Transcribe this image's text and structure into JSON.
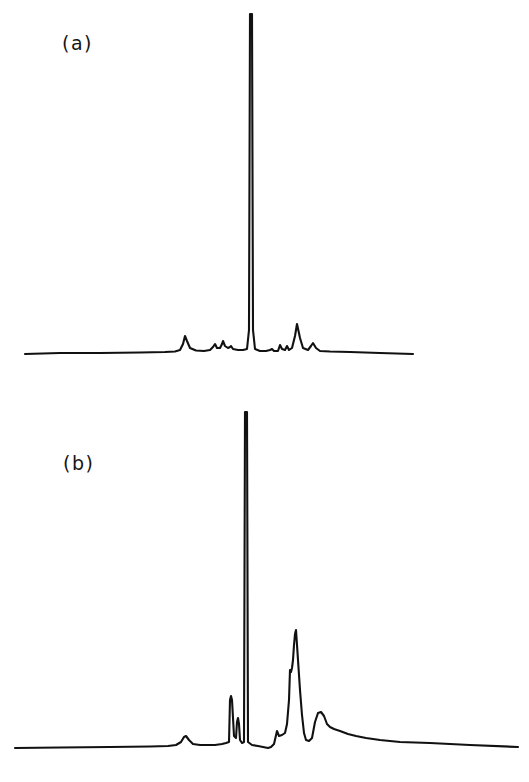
{
  "figure": {
    "background_color": "#ffffff",
    "trace_color": "#111111",
    "panels": [
      {
        "id": "a",
        "label": "(a)"
      },
      {
        "id": "b",
        "label": "(b)"
      }
    ]
  },
  "chart_data": [
    {
      "type": "line",
      "id": "panel-a",
      "title": "(a)",
      "subtitle": "",
      "xlabel": "",
      "ylabel": "",
      "axis_visible": false,
      "grid": false,
      "legend": null,
      "annotations": [
        "(a)"
      ],
      "xlim": [
        25,
        413
      ],
      "ylim": [
        0,
        345
      ],
      "baseline_y_px": 354,
      "description": "Chromatogram trace with a single dominant narrow peak near the centre, flanked by several small peaks on a flat baseline.",
      "peaks": [
        {
          "x": 185,
          "height": 18,
          "width": 13,
          "label": "minor-peak-1"
        },
        {
          "x": 215,
          "height": 10,
          "width": 7,
          "label": "minor-peak-2"
        },
        {
          "x": 223,
          "height": 13,
          "width": 6,
          "label": "minor-peak-3"
        },
        {
          "x": 231,
          "height": 8,
          "width": 6,
          "label": "minor-peak-4"
        },
        {
          "x": 251,
          "height": 340,
          "width": 5,
          "label": "main-peak"
        },
        {
          "x": 272,
          "height": 5,
          "width": 7,
          "label": "minor-peak-5"
        },
        {
          "x": 280,
          "height": 9,
          "width": 6,
          "label": "minor-peak-6"
        },
        {
          "x": 287,
          "height": 8,
          "width": 6,
          "label": "minor-peak-7"
        },
        {
          "x": 297,
          "height": 30,
          "width": 9,
          "label": "secondary-peak"
        },
        {
          "x": 313,
          "height": 11,
          "width": 9,
          "label": "minor-peak-8"
        }
      ],
      "points": [
        [
          25,
          354
        ],
        [
          60,
          353
        ],
        [
          100,
          353
        ],
        [
          140,
          352.5
        ],
        [
          165,
          352
        ],
        [
          175,
          351.5
        ],
        [
          180,
          350
        ],
        [
          183,
          344
        ],
        [
          185,
          336
        ],
        [
          187,
          341
        ],
        [
          190,
          348
        ],
        [
          196,
          350.5
        ],
        [
          204,
          351
        ],
        [
          210,
          350
        ],
        [
          213,
          347
        ],
        [
          215,
          344
        ],
        [
          217,
          348
        ],
        [
          220,
          348
        ],
        [
          222,
          344
        ],
        [
          223,
          341
        ],
        [
          225,
          346
        ],
        [
          228,
          348
        ],
        [
          230,
          347
        ],
        [
          231,
          346
        ],
        [
          233,
          349
        ],
        [
          238,
          350
        ],
        [
          243,
          350
        ],
        [
          247,
          349
        ],
        [
          249,
          330
        ],
        [
          250,
          14
        ],
        [
          252,
          14
        ],
        [
          253,
          330
        ],
        [
          255,
          349
        ],
        [
          260,
          351
        ],
        [
          266,
          351
        ],
        [
          270,
          350
        ],
        [
          272,
          349
        ],
        [
          274,
          351
        ],
        [
          278,
          351
        ],
        [
          280,
          345
        ],
        [
          282,
          349
        ],
        [
          285,
          350
        ],
        [
          287,
          346
        ],
        [
          289,
          350
        ],
        [
          292,
          348
        ],
        [
          295,
          336
        ],
        [
          297,
          324
        ],
        [
          300,
          338
        ],
        [
          303,
          348
        ],
        [
          308,
          350
        ],
        [
          311,
          346
        ],
        [
          313,
          343
        ],
        [
          316,
          348
        ],
        [
          320,
          351
        ],
        [
          330,
          351.5
        ],
        [
          350,
          352
        ],
        [
          380,
          353
        ],
        [
          413,
          354
        ]
      ]
    },
    {
      "type": "line",
      "id": "panel-b",
      "title": "(b)",
      "subtitle": "",
      "xlabel": "",
      "ylabel": "",
      "axis_visible": false,
      "grid": false,
      "legend": null,
      "annotations": [
        "(b)"
      ],
      "xlim": [
        15,
        518
      ],
      "ylim": [
        0,
        340
      ],
      "baseline_y_px": 748,
      "description": "Chromatogram trace with a tall narrow central peak, a sharp satellite spike to its left, a strong twin-topped secondary peak cluster on the right and a broad trailing hump.",
      "peaks": [
        {
          "x": 186,
          "height": 12,
          "width": 13,
          "label": "minor-peak-1"
        },
        {
          "x": 231,
          "height": 52,
          "width": 5,
          "label": "satellite-spike"
        },
        {
          "x": 238,
          "height": 30,
          "width": 4,
          "label": "satellite-shoulder"
        },
        {
          "x": 246,
          "height": 336,
          "width": 5,
          "label": "main-peak"
        },
        {
          "x": 277,
          "height": 17,
          "width": 6,
          "label": "minor-peak-2"
        },
        {
          "x": 290,
          "height": 78,
          "width": 6,
          "label": "secondary-shoulder"
        },
        {
          "x": 296,
          "height": 118,
          "width": 8,
          "label": "secondary-peak"
        },
        {
          "x": 320,
          "height": 36,
          "width": 16,
          "label": "broad-hump"
        }
      ],
      "points": [
        [
          15,
          748
        ],
        [
          60,
          747.5
        ],
        [
          110,
          747
        ],
        [
          150,
          746.5
        ],
        [
          168,
          746
        ],
        [
          176,
          745
        ],
        [
          181,
          742
        ],
        [
          184,
          737
        ],
        [
          186,
          736
        ],
        [
          189,
          740
        ],
        [
          193,
          744
        ],
        [
          200,
          745
        ],
        [
          215,
          745
        ],
        [
          222,
          744
        ],
        [
          226,
          743
        ],
        [
          229,
          742
        ],
        [
          230,
          700
        ],
        [
          231,
          696
        ],
        [
          232,
          700
        ],
        [
          234,
          736
        ],
        [
          236,
          738
        ],
        [
          237,
          722
        ],
        [
          238,
          718
        ],
        [
          239,
          724
        ],
        [
          240,
          740
        ],
        [
          242,
          743
        ],
        [
          244,
          742
        ],
        [
          245,
          412
        ],
        [
          247,
          412
        ],
        [
          248,
          742
        ],
        [
          252,
          745
        ],
        [
          258,
          746
        ],
        [
          263,
          747
        ],
        [
          268,
          748
        ],
        [
          271,
          747
        ],
        [
          274,
          744
        ],
        [
          277,
          731
        ],
        [
          279,
          736
        ],
        [
          282,
          735
        ],
        [
          285,
          733
        ],
        [
          287,
          724
        ],
        [
          289,
          700
        ],
        [
          290,
          670
        ],
        [
          291,
          672
        ],
        [
          292,
          668
        ],
        [
          293,
          660
        ],
        [
          294,
          645
        ],
        [
          295,
          634
        ],
        [
          296,
          630
        ],
        [
          298,
          660
        ],
        [
          300,
          690
        ],
        [
          302,
          715
        ],
        [
          304,
          733
        ],
        [
          306,
          740
        ],
        [
          309,
          741
        ],
        [
          312,
          738
        ],
        [
          315,
          722
        ],
        [
          318,
          713
        ],
        [
          321,
          712
        ],
        [
          324,
          716
        ],
        [
          327,
          724
        ],
        [
          330,
          727
        ],
        [
          334,
          729
        ],
        [
          340,
          731
        ],
        [
          348,
          734
        ],
        [
          356,
          736
        ],
        [
          366,
          738
        ],
        [
          380,
          740
        ],
        [
          400,
          742
        ],
        [
          430,
          743
        ],
        [
          470,
          745
        ],
        [
          518,
          747
        ]
      ]
    }
  ]
}
